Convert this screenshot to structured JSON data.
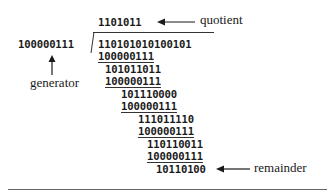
{
  "diagram": {
    "quotient": {
      "value": "1101011",
      "label": "quotient"
    },
    "generator": {
      "value": "100000111",
      "label": "generator"
    },
    "dividend": "110101010100101",
    "steps": [
      {
        "subtract": "100000111",
        "result": "101011011"
      },
      {
        "subtract": "100000111",
        "result": "101110000"
      },
      {
        "subtract": "100000111",
        "result": "111011110"
      },
      {
        "subtract": "100000111",
        "result": "110110011"
      },
      {
        "subtract": "100000111",
        "result": "10110100"
      }
    ],
    "remainder": {
      "value": "10110100",
      "label": "remainder"
    }
  }
}
